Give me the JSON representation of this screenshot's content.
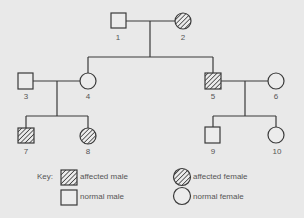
{
  "pedigree": {
    "individuals": [
      {
        "id": "1",
        "sex": "male",
        "affected": false
      },
      {
        "id": "2",
        "sex": "female",
        "affected": true
      },
      {
        "id": "3",
        "sex": "male",
        "affected": false
      },
      {
        "id": "4",
        "sex": "female",
        "affected": false
      },
      {
        "id": "5",
        "sex": "male",
        "affected": true
      },
      {
        "id": "6",
        "sex": "female",
        "affected": false
      },
      {
        "id": "7",
        "sex": "male",
        "affected": true
      },
      {
        "id": "8",
        "sex": "female",
        "affected": true
      },
      {
        "id": "9",
        "sex": "male",
        "affected": false
      },
      {
        "id": "10",
        "sex": "female",
        "affected": false
      }
    ],
    "couples": [
      [
        "1",
        "2"
      ],
      [
        "3",
        "4"
      ],
      [
        "5",
        "6"
      ]
    ],
    "children": {
      "1+2": [
        "4",
        "5"
      ],
      "3+4": [
        "7",
        "8"
      ],
      "5+6": [
        "9",
        "10"
      ]
    }
  },
  "labels": {
    "p1": "1",
    "p2": "2",
    "p3": "3",
    "p4": "4",
    "p5": "5",
    "p6": "6",
    "p7": "7",
    "p8": "8",
    "p9": "9",
    "p10": "10"
  },
  "key": {
    "title": "Key:",
    "affected_male": "affected male",
    "normal_male": "normal male",
    "affected_female": "affected female",
    "normal_female": "normal female"
  },
  "colors": {
    "background": "#e9e9e9",
    "line": "#3a3a3a",
    "text": "#555555"
  }
}
